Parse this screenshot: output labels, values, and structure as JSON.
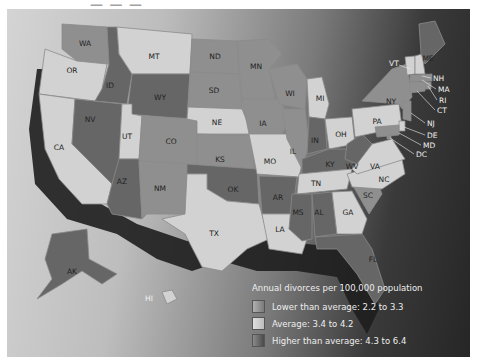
{
  "legend": {
    "title": "Annual divorces per 100,000 population",
    "categories": [
      {
        "key": "low",
        "label": "Lower than average: 2.2 to 3.3",
        "color": "#8c8c8c"
      },
      {
        "key": "avg",
        "label": "Average: 3.4 to 4.2",
        "color": "#c9c9c9"
      },
      {
        "key": "high",
        "label": "Higher than average: 4.3 to 6.4",
        "color": "#5e5e5e"
      }
    ]
  },
  "colors": {
    "low": "#8f8f8f",
    "avg": "#d2d2d2",
    "high": "#666666"
  },
  "states": [
    {
      "code": "WA",
      "cat": "low"
    },
    {
      "code": "OR",
      "cat": "avg"
    },
    {
      "code": "CA",
      "cat": "avg"
    },
    {
      "code": "ID",
      "cat": "high"
    },
    {
      "code": "NV",
      "cat": "high"
    },
    {
      "code": "MT",
      "cat": "avg"
    },
    {
      "code": "WY",
      "cat": "high"
    },
    {
      "code": "UT",
      "cat": "avg"
    },
    {
      "code": "AZ",
      "cat": "high"
    },
    {
      "code": "CO",
      "cat": "low"
    },
    {
      "code": "NM",
      "cat": "low"
    },
    {
      "code": "ND",
      "cat": "low"
    },
    {
      "code": "SD",
      "cat": "low"
    },
    {
      "code": "NE",
      "cat": "avg"
    },
    {
      "code": "KS",
      "cat": "low"
    },
    {
      "code": "OK",
      "cat": "high"
    },
    {
      "code": "TX",
      "cat": "avg"
    },
    {
      "code": "MN",
      "cat": "low"
    },
    {
      "code": "IA",
      "cat": "low"
    },
    {
      "code": "MO",
      "cat": "avg"
    },
    {
      "code": "AR",
      "cat": "high"
    },
    {
      "code": "LA",
      "cat": "avg"
    },
    {
      "code": "WI",
      "cat": "low"
    },
    {
      "code": "IL",
      "cat": "low"
    },
    {
      "code": "MI",
      "cat": "avg"
    },
    {
      "code": "IN",
      "cat": "high"
    },
    {
      "code": "OH",
      "cat": "avg"
    },
    {
      "code": "KY",
      "cat": "high"
    },
    {
      "code": "TN",
      "cat": "avg"
    },
    {
      "code": "MS",
      "cat": "high"
    },
    {
      "code": "AL",
      "cat": "high"
    },
    {
      "code": "GA",
      "cat": "avg"
    },
    {
      "code": "FL",
      "cat": "high"
    },
    {
      "code": "SC",
      "cat": "low"
    },
    {
      "code": "NC",
      "cat": "avg"
    },
    {
      "code": "VA",
      "cat": "avg"
    },
    {
      "code": "WV",
      "cat": "high"
    },
    {
      "code": "PA",
      "cat": "avg"
    },
    {
      "code": "NY",
      "cat": "low"
    },
    {
      "code": "VT",
      "cat": "avg"
    },
    {
      "code": "NH",
      "cat": "avg"
    },
    {
      "code": "ME",
      "cat": "high"
    },
    {
      "code": "MA",
      "cat": "low"
    },
    {
      "code": "RI",
      "cat": "low"
    },
    {
      "code": "CT",
      "cat": "low"
    },
    {
      "code": "NJ",
      "cat": "low"
    },
    {
      "code": "DE",
      "cat": "avg"
    },
    {
      "code": "MD",
      "cat": "low"
    },
    {
      "code": "DC",
      "cat": "low"
    },
    {
      "code": "AK",
      "cat": "high"
    },
    {
      "code": "HI",
      "cat": "avg"
    }
  ]
}
